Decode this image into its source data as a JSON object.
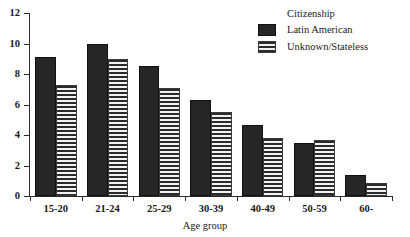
{
  "chart_data": {
    "type": "bar",
    "title": "",
    "xlabel": "Age group",
    "ylabel": "",
    "categories": [
      "15-20",
      "21-24",
      "25-29",
      "30-39",
      "40-49",
      "50-59",
      "60-"
    ],
    "series": [
      {
        "name": "Latin American",
        "values": [
          9.1,
          9.95,
          8.55,
          6.3,
          4.65,
          3.5,
          1.4
        ],
        "style": "solid-black"
      },
      {
        "name": "Unknown/Stateless",
        "values": [
          7.3,
          9.0,
          7.1,
          5.5,
          3.8,
          3.65,
          0.85
        ],
        "style": "horizontal-stripes"
      }
    ],
    "ylim": [
      0,
      12
    ],
    "yticks": [
      0,
      2,
      4,
      6,
      8,
      10,
      12
    ],
    "ytick_labels": [
      "0",
      "2",
      "4",
      "6",
      "8",
      "10",
      "12"
    ],
    "grid": false,
    "legend_position": "top-right"
  },
  "legend": {
    "title": "Citizenship",
    "entries": [
      {
        "label": "Latin American",
        "swatch": "solid-black-swatch"
      },
      {
        "label": "Unknown/Stateless",
        "swatch": "striped-swatch"
      }
    ]
  },
  "axes": {
    "x_title": "Age group"
  },
  "colors": {
    "bar_solid": "#262626",
    "bar_stripe": "#2b2b2b",
    "bar_stripe_bg": "#f2f2f2",
    "axis": "#2b2b2b",
    "text": "#1a1a1a",
    "background": "#ffffff"
  }
}
